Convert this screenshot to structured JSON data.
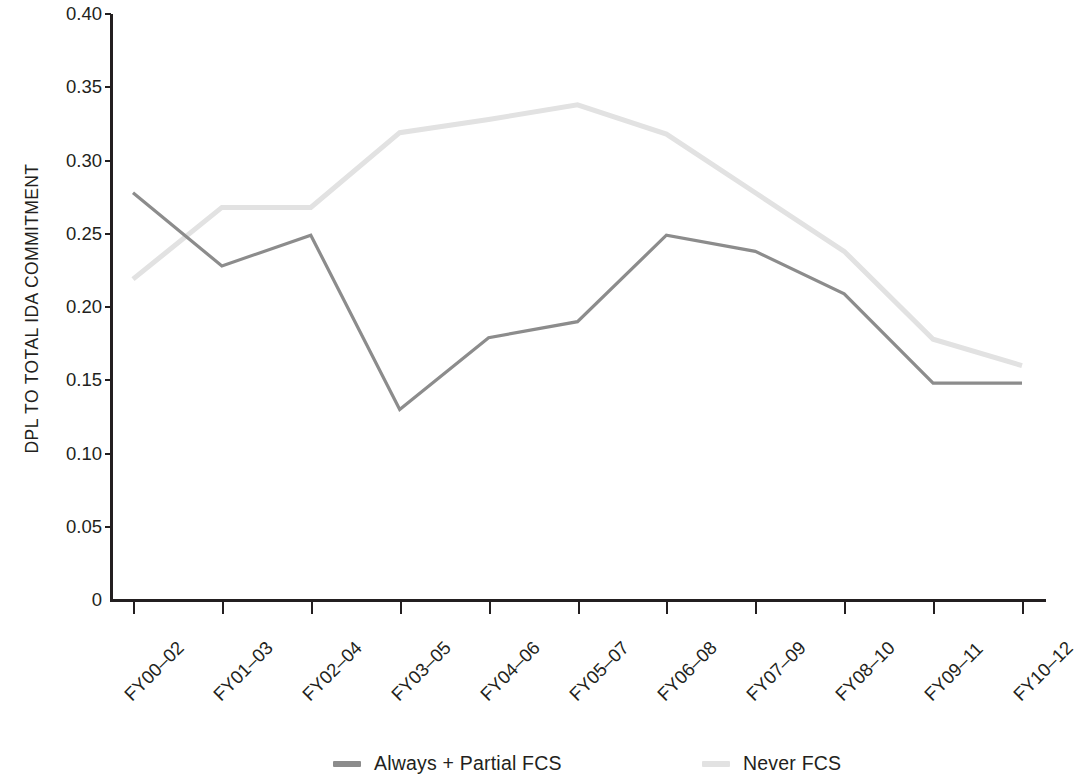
{
  "chart_data": {
    "type": "line",
    "title": "",
    "xlabel": "",
    "ylabel": "DPL TO TOTAL IDA COMMITMENT",
    "categories": [
      "FY00–02",
      "FY01–03",
      "FY02–04",
      "FY03–05",
      "FY04–06",
      "FY05–07",
      "FY06–08",
      "FY07–09",
      "FY08–10",
      "FY09–11",
      "FY10–12"
    ],
    "ylim": [
      0,
      0.4
    ],
    "yticks": [
      0,
      0.05,
      0.1,
      0.15,
      0.2,
      0.25,
      0.3,
      0.35,
      0.4
    ],
    "ytick_labels": [
      "0",
      "0.05",
      "0.10",
      "0.15",
      "0.20",
      "0.25",
      "0.30",
      "0.35",
      "0.40"
    ],
    "grid": false,
    "legend_position": "bottom",
    "series": [
      {
        "name": "Always + Partial FCS",
        "color": "#8c8c8c",
        "values": [
          0.278,
          0.228,
          0.249,
          0.13,
          0.179,
          0.19,
          0.249,
          0.238,
          0.209,
          0.148,
          0.148
        ]
      },
      {
        "name": "Never FCS",
        "color": "#e2e2e2",
        "values": [
          0.219,
          0.268,
          0.268,
          0.319,
          0.328,
          0.338,
          0.318,
          0.278,
          0.238,
          0.178,
          0.16
        ]
      }
    ]
  },
  "axis": {
    "y_title": "DPL TO TOTAL IDA COMMITMENT"
  },
  "legend": {
    "items": [
      {
        "label": "Always + Partial FCS",
        "color": "#8c8c8c"
      },
      {
        "label": "Never FCS",
        "color": "#e2e2e2"
      }
    ]
  },
  "colors": {
    "axis": "#231f20",
    "series_dark": "#8c8c8c",
    "series_light": "#e2e2e2",
    "background": "#ffffff"
  }
}
